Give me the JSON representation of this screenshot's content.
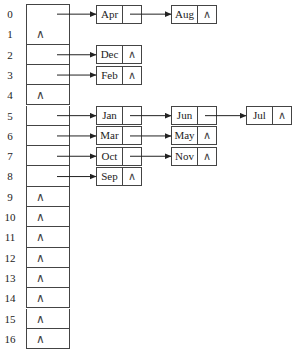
{
  "diagram": {
    "type": "hash-table-separate-chaining",
    "null_symbol": "∧",
    "buckets": [
      {
        "index": "0",
        "chain": [
          "Apr",
          "Aug"
        ]
      },
      {
        "index": "1",
        "chain": []
      },
      {
        "index": "2",
        "chain": [
          "Dec"
        ]
      },
      {
        "index": "3",
        "chain": [
          "Feb"
        ]
      },
      {
        "index": "4",
        "chain": []
      },
      {
        "index": "5",
        "chain": [
          "Jan",
          "Jun",
          "Jul"
        ]
      },
      {
        "index": "6",
        "chain": [
          "Mar",
          "May"
        ]
      },
      {
        "index": "7",
        "chain": [
          "Oct",
          "Nov"
        ]
      },
      {
        "index": "8",
        "chain": [
          "Sep"
        ]
      },
      {
        "index": "9",
        "chain": []
      },
      {
        "index": "10",
        "chain": []
      },
      {
        "index": "11",
        "chain": []
      },
      {
        "index": "12",
        "chain": []
      },
      {
        "index": "13",
        "chain": []
      },
      {
        "index": "14",
        "chain": []
      },
      {
        "index": "15",
        "chain": []
      },
      {
        "index": "16",
        "chain": []
      }
    ]
  }
}
